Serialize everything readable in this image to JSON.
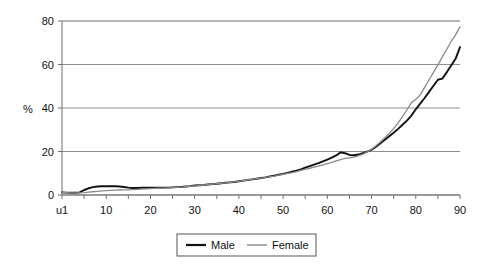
{
  "chart_data": {
    "type": "line",
    "title": "",
    "subtitle": "",
    "xlabel": "",
    "ylabel": "%",
    "xlim": [
      0,
      90
    ],
    "ylim": [
      0,
      80
    ],
    "grid": true,
    "grid_axis": "y",
    "legend_position": "bottom",
    "y_ticks": [
      "0",
      "20",
      "40",
      "60",
      "80"
    ],
    "y_tick_values": [
      0,
      20,
      40,
      60,
      80
    ],
    "x_ticks": [
      "u1",
      "10",
      "20",
      "30",
      "40",
      "50",
      "60",
      "70",
      "80",
      "90"
    ],
    "x_tick_values": [
      0,
      10,
      20,
      30,
      40,
      50,
      60,
      70,
      80,
      90
    ],
    "x_minor_tick_step": 5,
    "x": [
      0,
      1,
      2,
      3,
      4,
      5,
      6,
      7,
      8,
      9,
      10,
      11,
      12,
      13,
      14,
      15,
      16,
      17,
      18,
      19,
      20,
      21,
      22,
      23,
      24,
      25,
      26,
      27,
      28,
      29,
      30,
      31,
      32,
      33,
      34,
      35,
      36,
      37,
      38,
      39,
      40,
      41,
      42,
      43,
      44,
      45,
      46,
      47,
      48,
      49,
      50,
      51,
      52,
      53,
      54,
      55,
      56,
      57,
      58,
      59,
      60,
      61,
      62,
      63,
      64,
      65,
      66,
      67,
      68,
      69,
      70,
      71,
      72,
      73,
      74,
      75,
      76,
      77,
      78,
      79,
      80,
      81,
      82,
      83,
      84,
      85,
      86,
      87,
      88,
      89,
      90
    ],
    "series": [
      {
        "name": "Male",
        "color": "#111111",
        "width": 1.9,
        "values": [
          1.2,
          1.1,
          1.0,
          1.0,
          1.2,
          2.3,
          3.1,
          3.6,
          3.9,
          4.0,
          4.0,
          4.0,
          4.0,
          3.9,
          3.7,
          3.4,
          3.2,
          3.2,
          3.3,
          3.3,
          3.3,
          3.3,
          3.3,
          3.4,
          3.4,
          3.5,
          3.6,
          3.7,
          3.9,
          4.1,
          4.4,
          4.5,
          4.6,
          4.8,
          5.0,
          5.2,
          5.4,
          5.6,
          5.8,
          6.0,
          6.3,
          6.6,
          6.9,
          7.2,
          7.5,
          7.8,
          8.1,
          8.5,
          8.9,
          9.3,
          9.7,
          10.2,
          10.7,
          11.2,
          11.8,
          12.6,
          13.3,
          14.0,
          14.7,
          15.5,
          16.3,
          17.2,
          18.2,
          19.6,
          19.2,
          18.4,
          18.3,
          18.6,
          19.2,
          19.9,
          20.8,
          22.2,
          23.8,
          25.4,
          27.0,
          28.6,
          30.4,
          32.3,
          34.2,
          36.5,
          39.4,
          42.0,
          44.6,
          47.4,
          50.2,
          53.0,
          53.5,
          56.4,
          59.5,
          62.6,
          68.0
        ]
      },
      {
        "name": "Female",
        "color": "#8a8a8a",
        "width": 1.3,
        "values": [
          1.2,
          1.1,
          1.0,
          1.0,
          1.0,
          1.1,
          1.3,
          1.5,
          1.7,
          1.9,
          2.0,
          2.1,
          2.2,
          2.3,
          2.4,
          2.4,
          2.5,
          2.6,
          2.7,
          2.8,
          2.9,
          3.0,
          3.1,
          3.2,
          3.3,
          3.4,
          3.5,
          3.6,
          3.8,
          4.0,
          4.2,
          4.4,
          4.6,
          4.8,
          5.0,
          5.2,
          5.4,
          5.6,
          5.8,
          6.0,
          6.3,
          6.6,
          6.9,
          7.2,
          7.5,
          7.8,
          8.1,
          8.4,
          8.7,
          9.1,
          9.5,
          9.9,
          10.3,
          10.8,
          11.3,
          11.8,
          12.3,
          12.8,
          13.3,
          13.8,
          14.4,
          15.0,
          15.7,
          16.3,
          16.8,
          17.1,
          17.4,
          18.0,
          18.8,
          19.8,
          21.0,
          22.6,
          24.4,
          26.3,
          28.3,
          30.5,
          33.2,
          36.0,
          39.2,
          42.4,
          44.0,
          46.0,
          49.5,
          53.0,
          56.4,
          59.8,
          63.5,
          67.0,
          70.6,
          73.6,
          77.3
        ]
      }
    ],
    "annotations": []
  },
  "legend": {
    "items": [
      {
        "label": "Male",
        "color": "#111111",
        "width": 2.2
      },
      {
        "label": "Female",
        "color": "#8a8a8a",
        "width": 1.4
      }
    ]
  },
  "axis": {
    "y_title": "%"
  }
}
